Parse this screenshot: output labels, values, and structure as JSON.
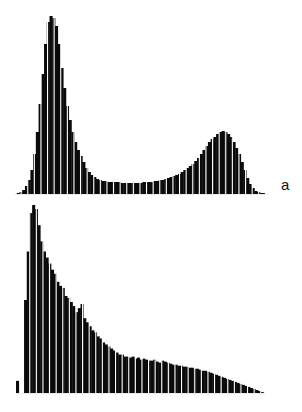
{
  "chart_data": [
    {
      "type": "bar",
      "title": "",
      "panel_label": "a",
      "xlabel": "",
      "ylabel": "",
      "grid": false,
      "legend": null,
      "description": "Bimodal intensity histogram: sharp narrow peak at low values, flat valley, broad second peak at high values",
      "x_range": [
        0,
        255
      ],
      "values": [
        0,
        1,
        2,
        4,
        8,
        14,
        24,
        40,
        62,
        90,
        120,
        150,
        172,
        178,
        176,
        168,
        150,
        126,
        106,
        88,
        74,
        62,
        52,
        44,
        38,
        32,
        26,
        22,
        19,
        17,
        15,
        14,
        13,
        13,
        12,
        12,
        12,
        12,
        12,
        11,
        11,
        11,
        11,
        11,
        11,
        11,
        11,
        12,
        12,
        12,
        12,
        13,
        13,
        14,
        14,
        15,
        16,
        17,
        18,
        19,
        20,
        22,
        24,
        26,
        28,
        30,
        33,
        36,
        40,
        44,
        48,
        52,
        55,
        57,
        60,
        62,
        63,
        62,
        60,
        57,
        52,
        46,
        40,
        32,
        24,
        16,
        10,
        6,
        3,
        2,
        1,
        1,
        0
      ]
    },
    {
      "type": "bar",
      "title": "",
      "panel_label": "b",
      "xlabel": "",
      "ylabel": "",
      "grid": false,
      "legend": null,
      "description": "Unimodal right-skewed histogram: sharp peak near low end with long decaying tail",
      "x_range": [
        0,
        255
      ],
      "values": [
        12,
        0,
        0,
        92,
        140,
        178,
        186,
        182,
        166,
        150,
        140,
        134,
        128,
        122,
        118,
        110,
        106,
        104,
        96,
        94,
        90,
        86,
        80,
        84,
        88,
        74,
        70,
        66,
        62,
        60,
        56,
        54,
        50,
        48,
        46,
        44,
        42,
        40,
        38,
        38,
        36,
        36,
        35,
        36,
        34,
        35,
        33,
        34,
        33,
        32,
        32,
        33,
        31,
        30,
        32,
        31,
        30,
        29,
        28,
        28,
        27,
        27,
        26,
        26,
        25,
        25,
        24,
        24,
        23,
        22,
        22,
        21,
        20,
        19,
        18,
        17,
        16,
        15,
        14,
        13,
        12,
        11,
        10,
        9,
        8,
        7,
        6,
        5,
        4,
        3,
        2,
        1,
        0
      ]
    }
  ],
  "labels": {
    "a": "a",
    "b": "b"
  }
}
